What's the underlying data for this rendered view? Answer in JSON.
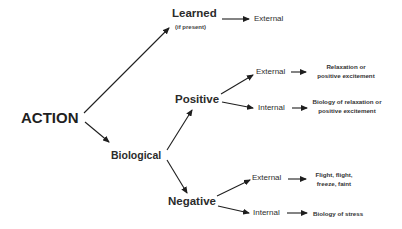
{
  "diagram": {
    "root": {
      "label": "ACTION"
    },
    "learned": {
      "label": "Learned",
      "note": "(if present)",
      "outcome": "External"
    },
    "biological": {
      "label": "Biological",
      "positive": {
        "label": "Positive",
        "external": {
          "label": "External",
          "result_line1": "Relaxation or",
          "result_line2": "positive excitement"
        },
        "internal": {
          "label": "Internal",
          "result_line1": "Biology of relaxation or",
          "result_line2": "positive excitement"
        }
      },
      "negative": {
        "label": "Negative",
        "external": {
          "label": "External",
          "result_line1": "Flight, flight,",
          "result_line2": "freeze, faint"
        },
        "internal": {
          "label": "Internal",
          "result": "Biology of stress"
        }
      }
    },
    "edges": [
      {
        "from": "ACTION",
        "to": "Learned"
      },
      {
        "from": "ACTION",
        "to": "Biological"
      },
      {
        "from": "Learned",
        "to": "External"
      },
      {
        "from": "Biological",
        "to": "Positive"
      },
      {
        "from": "Biological",
        "to": "Negative"
      },
      {
        "from": "Positive",
        "to": "External"
      },
      {
        "from": "Positive",
        "to": "Internal"
      },
      {
        "from": "Negative",
        "to": "External"
      },
      {
        "from": "Negative",
        "to": "Internal"
      },
      {
        "from": "External (Positive)",
        "to": "Relaxation or positive excitement"
      },
      {
        "from": "Internal (Positive)",
        "to": "Biology of relaxation or positive excitement"
      },
      {
        "from": "External (Negative)",
        "to": "Flight, flight, freeze, faint"
      },
      {
        "from": "Internal (Negative)",
        "to": "Biology of stress"
      }
    ]
  }
}
